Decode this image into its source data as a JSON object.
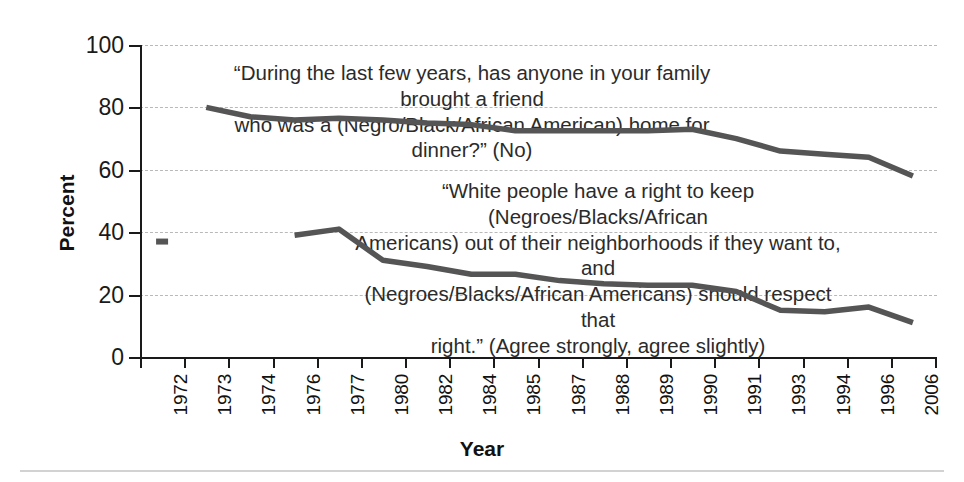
{
  "chart_data": {
    "type": "line",
    "title": "",
    "xlabel": "Year",
    "ylabel": "Percent",
    "ylim": [
      0,
      100
    ],
    "yticks": [
      0,
      20,
      40,
      60,
      80,
      100
    ],
    "grid": "horizontal-dashed",
    "legend": "none (inline annotations)",
    "categories": [
      "1972",
      "1973",
      "1974",
      "1976",
      "1977",
      "1980",
      "1982",
      "1984",
      "1985",
      "1987",
      "1988",
      "1989",
      "1990",
      "1991",
      "1993",
      "1994",
      "1996",
      "2006"
    ],
    "series": [
      {
        "name": "“During the last few years, has anyone in your family brought a friend who was a (Negro/Black/African American) home for dinner?” (No)",
        "x": [
          "1973",
          "1974",
          "1976",
          "1977",
          "1980",
          "1982",
          "1984",
          "1985",
          "1987",
          "1988",
          "1989",
          "1990",
          "1991",
          "1993",
          "1994",
          "1996",
          "2006"
        ],
        "values": [
          80,
          77,
          76,
          76.5,
          76,
          75,
          74.5,
          72.5,
          72.5,
          72.5,
          72.5,
          73,
          70,
          66,
          65,
          64,
          58
        ]
      },
      {
        "name": "“White people have a right to keep (Negroes/Blacks/African Americans) out of their neighborhoods if they want to, and (Negroes/Blacks/African Americans) should respect that right.” (Agree strongly, agree slightly)",
        "x": [
          "1976",
          "1977",
          "1980",
          "1982",
          "1984",
          "1985",
          "1987",
          "1988",
          "1989",
          "1990",
          "1991",
          "1993",
          "1994",
          "1996",
          "2006"
        ],
        "values": [
          39,
          41,
          31,
          29,
          26.5,
          26.5,
          24.5,
          23.5,
          23,
          23,
          21,
          15,
          14.5,
          16,
          11
        ]
      },
      {
        "name": "isolated-marker",
        "x": [
          "1972"
        ],
        "values": [
          37
        ]
      }
    ],
    "annotations": [
      {
        "id": "annot-top",
        "text": "“During the last few years, has anyone in your family brought a friend\nwho was a (Negro/Black/African American) home for dinner?” (No)"
      },
      {
        "id": "annot-bottom",
        "text": "“White people have a right to keep (Negroes/Blacks/African\nAmericans) out of their neighborhoods if they want to, and\n(Negroes/Blacks/African Americans) should respect that\nright.” (Agree strongly, agree slightly)"
      }
    ],
    "colors": {
      "line": "#555555",
      "axis": "#1a1a1a",
      "grid": "#b9b9b9",
      "background": "#ffffff",
      "rule": "#d2d2d2"
    }
  }
}
